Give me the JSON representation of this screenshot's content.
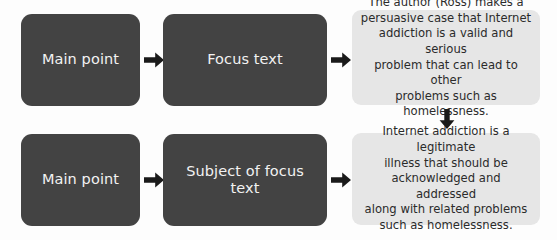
{
  "diagram": {
    "colors": {
      "dark_box": "#434343",
      "light_box": "#e6e6e6",
      "dark_box_text": "#f2f2f2",
      "light_box_text": "#2b2b2b",
      "arrow": "#1a1a1a",
      "background": "#fdfdfd"
    },
    "rows": [
      {
        "id": "row-1",
        "box_a_label": "Main point",
        "arrow_a_icon": "arrow-right-icon",
        "box_b_label": "Focus text",
        "arrow_b_icon": "arrow-right-icon",
        "panel_text": "The author (Ross) makes a\npersuasive case that Internet\naddiction is a valid and serious\nproblem that can lead to other\nproblems such as homelessness."
      },
      {
        "id": "row-2",
        "box_a_label": "Main point",
        "arrow_a_icon": "arrow-right-icon",
        "box_b_label": "Subject of focus\ntext",
        "arrow_b_icon": "arrow-right-icon",
        "panel_text": "Internet addiction is a legitimate\nillness that should be\nacknowledged and addressed\nalong with related problems\nsuch as homelessness."
      }
    ],
    "connector": {
      "icon": "arrow-down-icon"
    }
  }
}
